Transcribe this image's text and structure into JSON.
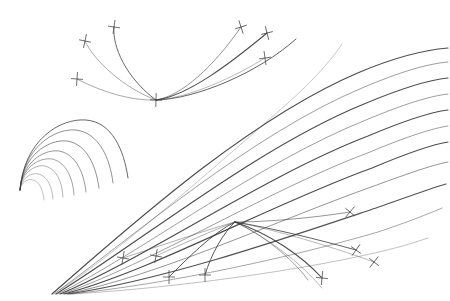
{
  "figure": {
    "width": 450,
    "height": 301,
    "background_color": "#ffffff",
    "stroke_color": "#3a3a3a",
    "tick_color": "#4a4a4a"
  },
  "chart_data": {
    "type": "line",
    "title": "",
    "subtitle": "",
    "xlabel": "",
    "ylabel": "",
    "xlim": [
      0,
      450
    ],
    "ylim": [
      0,
      301
    ],
    "grid": false,
    "legend": null,
    "annotations": [],
    "clusters": [
      {
        "name": "top-pencil",
        "focus": [
          156,
          100
        ],
        "stroke_color": "#3a3a3a",
        "curves": [
          {
            "id": "t1",
            "d": "M 114 27 C 112 46 126 78 156 100",
            "width": 0.9,
            "opacity": 0.85
          },
          {
            "id": "t2",
            "d": "M 85 41 C 95 62 124 88 156 100",
            "width": 0.8,
            "opacity": 0.55
          },
          {
            "id": "t3",
            "d": "M 77 79 C 100 91 130 101 156 100",
            "width": 0.8,
            "opacity": 0.55
          },
          {
            "id": "t4",
            "d": "M 156 100 C 182 96 214 66 241 27",
            "width": 0.9,
            "opacity": 0.6
          },
          {
            "id": "t5",
            "d": "M 156 100 C 188 96 232 62 267 33",
            "width": 1.1,
            "opacity": 0.9
          },
          {
            "id": "t6",
            "d": "M 156 100 C 190 98 236 76 265 58",
            "width": 0.8,
            "opacity": 0.45
          },
          {
            "id": "t7",
            "d": "M 156 100 C 196 99 258 73 296 39",
            "width": 1.0,
            "opacity": 0.8
          }
        ],
        "ticks": [
          {
            "x": 114,
            "y": 27,
            "angle": 8
          },
          {
            "x": 85,
            "y": 41,
            "angle": 12
          },
          {
            "x": 77,
            "y": 79,
            "angle": 4
          },
          {
            "x": 156,
            "y": 100,
            "angle": 2
          },
          {
            "x": 241,
            "y": 27,
            "angle": -18
          },
          {
            "x": 267,
            "y": 33,
            "angle": -14
          },
          {
            "x": 265,
            "y": 58,
            "angle": -8
          }
        ]
      },
      {
        "name": "left-nested-arcs",
        "focus": [
          20,
          190
        ],
        "stroke_color": "#3a3a3a",
        "curves": [
          {
            "id": "l1",
            "d": "M 20 190 C 24 140 60 118 86 120 C 112 122 124 150 128 178",
            "width": 0.9,
            "opacity": 0.85
          },
          {
            "id": "l2",
            "d": "M 20 190 C 23 148 54 128 76 130 C 99 133 110 158 113 183",
            "width": 0.8,
            "opacity": 0.7
          },
          {
            "id": "l3",
            "d": "M 20 190 C 22 156 48 139 67 141 C 87 144 96 166 99 188",
            "width": 0.8,
            "opacity": 0.7
          },
          {
            "id": "l4",
            "d": "M 20 190 C 22 163 43 149 59 151 C 76 154 84 173 86 192",
            "width": 0.8,
            "opacity": 0.65
          },
          {
            "id": "l5",
            "d": "M 20 190 C 21 169 38 157 52 159 C 66 162 73 178 74 195",
            "width": 0.8,
            "opacity": 0.6
          },
          {
            "id": "l6",
            "d": "M 20 190 C 21 174 34 164 45 166 C 57 169 62 182 63 197",
            "width": 0.7,
            "opacity": 0.55
          },
          {
            "id": "l7",
            "d": "M 20 190 C 21 179 30 172 39 174 C 48 177 52 187 53 199",
            "width": 0.7,
            "opacity": 0.5
          },
          {
            "id": "l8",
            "d": "M 20 190 C 21 183 27 178 33 180 C 40 182 43 190 44 200",
            "width": 0.7,
            "opacity": 0.45
          }
        ],
        "ticks": []
      },
      {
        "name": "main-fan",
        "focus": [
          55,
          292
        ],
        "stroke_color": "#3a3a3a",
        "curves": [
          {
            "id": "f1",
            "d": "M 52 294 C 130 226 250 118 360 72 C 398 56 424 50 448 48",
            "width": 1.2,
            "opacity": 0.9
          },
          {
            "id": "f2",
            "d": "M 54 294 C 134 236 252 134 362 88 C 400 72 426 64 448 62",
            "width": 0.9,
            "opacity": 0.55
          },
          {
            "id": "f3",
            "d": "M 56 294 C 138 244 256 148 364 104 C 402 88 428 80 448 78",
            "width": 1.2,
            "opacity": 0.9
          },
          {
            "id": "f4",
            "d": "M 58 294 C 142 252 260 162 366 120 C 404 104 430 96 448 94",
            "width": 0.9,
            "opacity": 0.55
          },
          {
            "id": "f5",
            "d": "M 60 294 C 146 258 264 176 368 136 C 406 120 432 112 448 110",
            "width": 1.2,
            "opacity": 0.9
          },
          {
            "id": "f6",
            "d": "M 62 294 C 150 264 268 190 370 152 C 408 136 434 128 448 126",
            "width": 0.9,
            "opacity": 0.55
          },
          {
            "id": "f7",
            "d": "M 64 294 C 154 270 272 204 372 168 C 410 152 436 144 448 142",
            "width": 1.2,
            "opacity": 0.9
          },
          {
            "id": "f8",
            "d": "M 66 294 C 158 276 278 220 374 186 C 412 172 436 164 448 162",
            "width": 0.9,
            "opacity": 0.6
          },
          {
            "id": "f9",
            "d": "M 68 294 C 164 280 286 238 376 208 C 410 196 432 188 446 184",
            "width": 1.2,
            "opacity": 0.88
          },
          {
            "id": "f10",
            "d": "M 70 294 C 170 284 296 256 378 232 C 408 222 428 214 442 208",
            "width": 0.9,
            "opacity": 0.5
          },
          {
            "id": "f11",
            "d": "M 72 294 C 176 288 300 270 370 254 C 398 248 416 242 428 238",
            "width": 0.8,
            "opacity": 0.4
          },
          {
            "id": "f12",
            "d": "M 60 290 C 120 250 200 180 280 110 C 310 84 330 62 342 44",
            "width": 0.8,
            "opacity": 0.35
          }
        ],
        "ticks": []
      },
      {
        "name": "bottom-pencil",
        "focus": [
          235,
          222
        ],
        "stroke_color": "#3a3a3a",
        "curves": [
          {
            "id": "b1",
            "d": "M 123 258 C 160 246 206 230 235 222",
            "width": 0.8,
            "opacity": 0.5
          },
          {
            "id": "b2",
            "d": "M 156 256 C 182 244 214 230 235 222",
            "width": 0.8,
            "opacity": 0.5
          },
          {
            "id": "b3",
            "d": "M 169 277 C 186 260 212 233 235 222",
            "width": 1.0,
            "opacity": 0.85
          },
          {
            "id": "b4",
            "d": "M 205 275 C 211 254 224 232 235 222",
            "width": 1.0,
            "opacity": 0.85
          },
          {
            "id": "b5",
            "d": "M 235 222 C 268 222 312 218 350 212",
            "width": 0.9,
            "opacity": 0.6
          },
          {
            "id": "b6",
            "d": "M 235 222 C 272 228 320 240 356 250",
            "width": 1.0,
            "opacity": 0.8
          },
          {
            "id": "b7",
            "d": "M 235 222 C 270 234 302 256 322 278",
            "width": 1.1,
            "opacity": 0.9
          },
          {
            "id": "b8",
            "d": "M 235 222 C 268 238 300 262 322 288",
            "width": 0.8,
            "opacity": 0.45
          },
          {
            "id": "b9",
            "d": "M 235 222 C 276 230 330 246 374 262",
            "width": 0.8,
            "opacity": 0.45
          },
          {
            "id": "b10",
            "d": "M 235 222 C 262 234 292 258 308 280",
            "width": 0.9,
            "opacity": 0.55
          }
        ],
        "ticks": [
          {
            "x": 123,
            "y": 258,
            "angle": 10
          },
          {
            "x": 156,
            "y": 256,
            "angle": 10
          },
          {
            "x": 169,
            "y": 277,
            "angle": 0
          },
          {
            "x": 205,
            "y": 275,
            "angle": 0
          },
          {
            "x": 350,
            "y": 212,
            "angle": 40
          },
          {
            "x": 356,
            "y": 250,
            "angle": 35
          },
          {
            "x": 322,
            "y": 278,
            "angle": 6
          },
          {
            "x": 374,
            "y": 262,
            "angle": 38
          }
        ]
      }
    ]
  }
}
